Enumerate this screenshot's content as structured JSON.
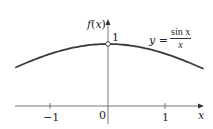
{
  "chart_data": {
    "type": "line",
    "title": "",
    "xlabel": "x",
    "ylabel": "f(x)",
    "xlim": [
      -1.62,
      1.67
    ],
    "ylim": [
      0,
      1
    ],
    "grid": false,
    "legend": null,
    "x_ticks": [
      -1,
      0,
      1
    ],
    "x_tick_labels": [
      "−1",
      "0",
      "1"
    ],
    "y_tick_labels": [
      "1"
    ],
    "series": [
      {
        "name": "y = sin x / x",
        "function": "sin(x)/x",
        "x": [
          -1.6,
          -1.2,
          -0.8,
          -0.4,
          0,
          0.4,
          0.8,
          1.2,
          1.65
        ],
        "y": [
          0.625,
          0.777,
          0.897,
          0.974,
          1.0,
          0.974,
          0.897,
          0.777,
          0.605
        ]
      }
    ],
    "annotations": [
      {
        "type": "open-circle",
        "x": 0,
        "y": 1,
        "note": "function undefined at x = 0"
      },
      {
        "type": "label",
        "text": "y = sin x / x",
        "position": "upper-right"
      }
    ]
  },
  "labels": {
    "y_axis": "f(x)",
    "x_axis": "x",
    "y_one": "1",
    "origin": "0",
    "tick_neg1": "−1",
    "tick_pos1": "1",
    "eq_lhs": "y =",
    "eq_num": "sin x",
    "eq_den": "x"
  },
  "colors": {
    "curve": "#3a3a3a",
    "axes": "#555555"
  }
}
